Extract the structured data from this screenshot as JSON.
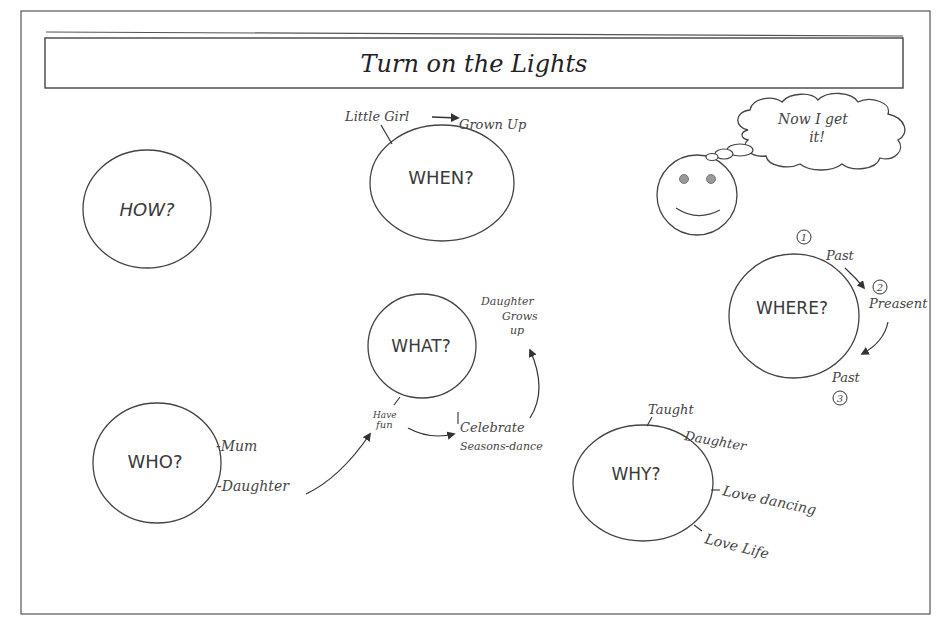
{
  "title": "Turn on the Lights",
  "thought_bubble": {
    "line1": "Now I get",
    "line2": "it!"
  },
  "colors": {
    "stroke": "#444444",
    "eye": "#9a9a9a",
    "background": "#ffffff"
  },
  "nodes": {
    "how": {
      "label": "HOW?"
    },
    "when": {
      "label": "WHEN?"
    },
    "what": {
      "label": "WHAT?"
    },
    "who": {
      "label": "WHO?"
    },
    "why": {
      "label": "WHY?"
    },
    "where": {
      "label": "WHERE?"
    }
  },
  "annotations": {
    "when": {
      "from": "Little Girl",
      "to": "Grown Up"
    },
    "what": {
      "have_fun_1": "Have",
      "have_fun_2": "fun",
      "celebrate": "Celebrate",
      "seasons": "Seasons-dance",
      "grows_1": "Daughter",
      "grows_2": "Grows",
      "grows_3": "up"
    },
    "who": {
      "mum": "-Mum",
      "daughter": "-Daughter"
    },
    "why": {
      "taught": "Taught",
      "daughter": "Daughter",
      "love_dancing": "Love dancing",
      "love_life": "Love Life"
    },
    "where": {
      "num1": "1",
      "past1": "Past",
      "num2": "2",
      "present": "Preasent",
      "past2": "Past",
      "num3": "3"
    }
  }
}
